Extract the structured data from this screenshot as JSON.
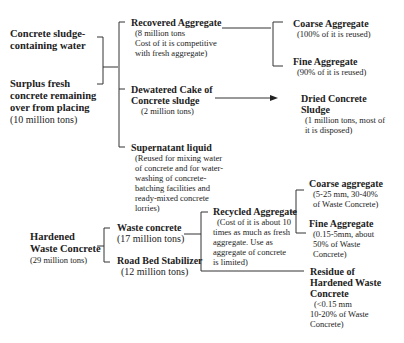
{
  "sources": {
    "sludge_water": {
      "title": "Concrete sludge-containing water",
      "lines": [
        "Concrete sludge-",
        "containing water"
      ]
    },
    "surplus_fresh": {
      "lines": [
        "Surplus fresh",
        "concrete remaining",
        "over from placing"
      ],
      "amount": "(10 million tons)"
    },
    "hardened_waste": {
      "lines": [
        "Hardened",
        "Waste Concrete"
      ],
      "amount": "(29 million tons)"
    }
  },
  "fresh_branch": {
    "recovered_aggregate": {
      "title": "Recovered Aggregate",
      "desc": [
        "(8 million tons",
        "Cost of it is competitive",
        "with fresh aggregate)"
      ]
    },
    "dewatered_cake": {
      "title_lines": [
        "Dewatered Cake of",
        "Concrete sludge"
      ],
      "desc": [
        "(2 million tons)"
      ]
    },
    "supernatant": {
      "title": "Supernatant liquid",
      "desc": [
        "(Reused for mixing water",
        "of concrete and for water-",
        "washing of concrete-",
        "batching facilities and",
        "ready-mixed concrete",
        "lorries)"
      ]
    },
    "coarse_aggregate": {
      "title": "Coarse Aggregate",
      "desc": [
        "(100% of it is reused)"
      ]
    },
    "fine_aggregate": {
      "title": "Fine Aggregate",
      "desc": [
        "(90% of it is reused)"
      ]
    },
    "dried_sludge": {
      "title_lines": [
        "Dried Concrete",
        "Sludge"
      ],
      "desc": [
        "(1 million tons, most of",
        "it is disposed)"
      ]
    }
  },
  "hardened_branch": {
    "waste_concrete": {
      "title": "Waste concrete",
      "amount": "(17 million tons)"
    },
    "road_bed": {
      "title": "Road Bed Stabilizer",
      "amount": "(12 million tons)"
    },
    "recycled_aggregate": {
      "title": "Recycled Aggregate",
      "desc": [
        "(Cost of it is about 10",
        "times as much as fresh",
        "aggregate. Use as",
        "aggregate of concrete",
        "is limited)"
      ]
    },
    "coarse_aggregate": {
      "title": "Coarse aggregate",
      "desc": [
        "(5-25 mm, 30-40%",
        "of Waste Concrete)"
      ]
    },
    "fine_aggregate": {
      "title": "Fine Aggregate",
      "desc": [
        "(0.15-5mm, about",
        "50% of Waste",
        "Concrete)"
      ]
    },
    "residue": {
      "title_lines": [
        "Residue of",
        "Hardened Waste",
        "Concrete"
      ],
      "desc": [
        "(<0.15 mm",
        "10-20% of Waste",
        "Concrete)"
      ]
    }
  },
  "icons": {
    "arrow": "arrow-right-icon"
  },
  "colors": {
    "line": "#333333",
    "text": "#222222",
    "background": "#ffffff"
  }
}
